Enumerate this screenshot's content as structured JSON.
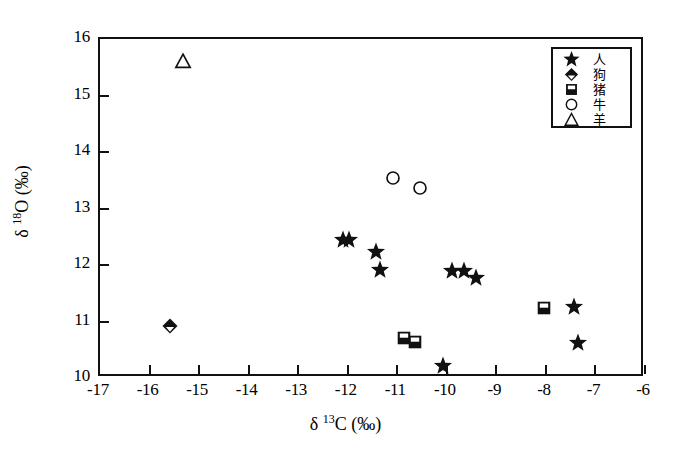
{
  "chart_data": {
    "type": "scatter",
    "title": "",
    "xlabel": "δ 13C (‰)",
    "ylabel": "δ 18O (‰)",
    "xlim": [
      -17,
      -6
    ],
    "ylim": [
      10,
      16
    ],
    "xticks": [
      "-17",
      "-16",
      "-15",
      "-14",
      "-13",
      "-12",
      "-11",
      "-10",
      "-9",
      "-8",
      "-7",
      "-6"
    ],
    "xtick_values": [
      -17,
      -16,
      -15,
      -14,
      -13,
      -12,
      -11,
      -10,
      -9,
      -8,
      -7,
      -6
    ],
    "yticks": [
      "10",
      "11",
      "12",
      "13",
      "14",
      "15",
      "16"
    ],
    "ytick_values": [
      10,
      11,
      12,
      13,
      14,
      15,
      16
    ],
    "grid": false,
    "legend_position": "top-right",
    "series": [
      {
        "name": "人",
        "marker": "star",
        "points": [
          {
            "x": -12.05,
            "y": 12.4
          },
          {
            "x": -11.93,
            "y": 12.4
          },
          {
            "x": -11.38,
            "y": 12.2
          },
          {
            "x": -11.3,
            "y": 11.87
          },
          {
            "x": -9.85,
            "y": 11.85
          },
          {
            "x": -9.62,
            "y": 11.85
          },
          {
            "x": -9.38,
            "y": 11.73
          },
          {
            "x": -10.03,
            "y": 10.18
          },
          {
            "x": -7.4,
            "y": 11.22
          },
          {
            "x": -7.32,
            "y": 10.58
          }
        ]
      },
      {
        "name": "狗",
        "marker": "diamond",
        "points": [
          {
            "x": -15.55,
            "y": 10.88
          }
        ]
      },
      {
        "name": "猪",
        "marker": "square-half",
        "points": [
          {
            "x": -10.82,
            "y": 10.68
          },
          {
            "x": -10.6,
            "y": 10.6
          },
          {
            "x": -8.0,
            "y": 11.2
          }
        ]
      },
      {
        "name": "牛",
        "marker": "circle",
        "points": [
          {
            "x": -11.05,
            "y": 13.5
          },
          {
            "x": -10.5,
            "y": 13.32
          }
        ]
      },
      {
        "name": "羊",
        "marker": "triangle",
        "points": [
          {
            "x": -15.28,
            "y": 15.57
          }
        ]
      }
    ]
  },
  "legend": {
    "items": [
      {
        "label": "人",
        "marker": "star"
      },
      {
        "label": "狗",
        "marker": "diamond"
      },
      {
        "label": "猪",
        "marker": "square-half"
      },
      {
        "label": "牛",
        "marker": "circle"
      },
      {
        "label": "羊",
        "marker": "triangle"
      }
    ]
  },
  "axes": {
    "x_title_prefix": "δ ",
    "x_title_sup": "13",
    "x_title_suffix": "C (‰)",
    "y_title_prefix": "δ ",
    "y_title_sup": "18",
    "y_title_suffix": "O (‰)"
  },
  "colors": {
    "marker": "#111111",
    "frame": "#111111",
    "background": "#ffffff"
  }
}
